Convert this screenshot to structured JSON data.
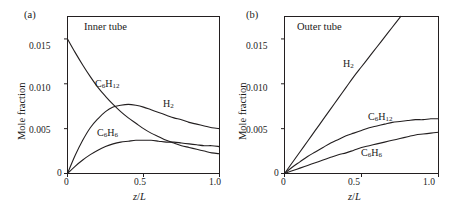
{
  "figure": {
    "panels": [
      {
        "tag": "(a)",
        "title": "Inner tube",
        "xlabel_italic": "z",
        "xlabel_slash": "/",
        "xlabel_italic2": "L",
        "ylabel": "Mole fraction",
        "xticks": [
          "0",
          "0.5",
          "1.0"
        ],
        "yticks": [
          "0",
          "0.005",
          "0.010",
          "0.015"
        ],
        "series_labels": {
          "h2": "H",
          "h2_sub": "2",
          "c6h12": "C",
          "c6h12_sub1": "6",
          "c6h12_mid": "H",
          "c6h12_sub2": "12",
          "c6h6": "C",
          "c6h6_sub1": "6",
          "c6h6_mid": "H",
          "c6h6_sub2": "6"
        }
      },
      {
        "tag": "(b)",
        "title": "Outer tube",
        "xlabel_italic": "z",
        "xlabel_slash": "/",
        "xlabel_italic2": "L",
        "ylabel": "Mole fraction",
        "xticks": [
          "0",
          "0.5",
          "1.0"
        ],
        "yticks": [
          "0",
          "0.005",
          "0.010",
          "0.015"
        ],
        "series_labels": {
          "h2": "H",
          "h2_sub": "2",
          "c6h12": "C",
          "c6h12_sub1": "6",
          "c6h12_mid": "H",
          "c6h12_sub2": "12",
          "c6h6": "C",
          "c6h6_sub1": "6",
          "c6h6_mid": "H",
          "c6h6_sub2": "6"
        }
      }
    ]
  },
  "chart_data": [
    {
      "type": "line",
      "title": "Inner tube",
      "panel": "(a)",
      "xlabel": "z/L",
      "ylabel": "Mole fraction",
      "xlim": [
        0,
        1.0
      ],
      "ylim": [
        0,
        0.0175
      ],
      "xticks": [
        0,
        0.5,
        1.0
      ],
      "yticks": [
        0,
        0.005,
        0.01,
        0.015
      ],
      "grid": false,
      "legend": "inline-curve-labels",
      "x": [
        0,
        0.05,
        0.1,
        0.15,
        0.2,
        0.25,
        0.3,
        0.35,
        0.4,
        0.45,
        0.5,
        0.55,
        0.6,
        0.65,
        0.7,
        0.75,
        0.8,
        0.85,
        0.9,
        0.95,
        1.0
      ],
      "series": [
        {
          "name": "C6H12",
          "values": [
            0.015,
            0.0135,
            0.0121,
            0.0108,
            0.0096,
            0.0086,
            0.0077,
            0.0069,
            0.0062,
            0.0056,
            0.005,
            0.0045,
            0.0041,
            0.0037,
            0.0034,
            0.0031,
            0.0029,
            0.0027,
            0.0025,
            0.0023,
            0.0022
          ]
        },
        {
          "name": "H2",
          "values": [
            0.0,
            0.002,
            0.0037,
            0.0051,
            0.0061,
            0.0069,
            0.0074,
            0.0076,
            0.0077,
            0.0076,
            0.0074,
            0.0071,
            0.0068,
            0.0065,
            0.0062,
            0.006,
            0.0057,
            0.0055,
            0.0053,
            0.0051,
            0.005
          ]
        },
        {
          "name": "C6H6",
          "values": [
            0.0,
            0.0008,
            0.0015,
            0.0021,
            0.0026,
            0.003,
            0.0033,
            0.0035,
            0.0036,
            0.0037,
            0.0037,
            0.0037,
            0.0036,
            0.0035,
            0.0035,
            0.0034,
            0.0033,
            0.0032,
            0.0031,
            0.0031,
            0.003
          ]
        }
      ]
    },
    {
      "type": "line",
      "title": "Outer tube",
      "panel": "(b)",
      "xlabel": "z/L",
      "ylabel": "Mole fraction",
      "xlim": [
        0,
        1.0
      ],
      "ylim": [
        0,
        0.0175
      ],
      "xticks": [
        0,
        0.5,
        1.0
      ],
      "yticks": [
        0,
        0.005,
        0.01,
        0.015
      ],
      "grid": false,
      "legend": "inline-curve-labels",
      "x": [
        0,
        0.05,
        0.1,
        0.15,
        0.2,
        0.25,
        0.3,
        0.35,
        0.4,
        0.45,
        0.5,
        0.55,
        0.6,
        0.65,
        0.7,
        0.75,
        0.8,
        0.85,
        0.9,
        0.95,
        1.0
      ],
      "series": [
        {
          "name": "H2",
          "values": [
            0.0,
            0.0012,
            0.0024,
            0.0036,
            0.0048,
            0.006,
            0.0072,
            0.0084,
            0.0096,
            0.0108,
            0.0119,
            0.013,
            0.0141,
            0.0152,
            0.0163,
            0.0174,
            0.0185,
            0.0196,
            0.0207,
            0.0218,
            0.0229
          ],
          "clipped_at_top": true,
          "note": "rises off the top of the axes near z/L = 0.84"
        },
        {
          "name": "C6H12",
          "values": [
            0.0,
            0.0007,
            0.0013,
            0.0019,
            0.0024,
            0.0029,
            0.0034,
            0.0038,
            0.0042,
            0.0045,
            0.0048,
            0.0051,
            0.0053,
            0.0055,
            0.0057,
            0.0058,
            0.0059,
            0.006,
            0.006,
            0.0061,
            0.0061
          ]
        },
        {
          "name": "C6H6",
          "values": [
            0.0,
            0.0003,
            0.0006,
            0.0009,
            0.0012,
            0.0015,
            0.0018,
            0.0021,
            0.0023,
            0.0026,
            0.0029,
            0.0031,
            0.0033,
            0.0035,
            0.0037,
            0.0039,
            0.0041,
            0.0043,
            0.0044,
            0.0045,
            0.0046
          ]
        }
      ]
    }
  ]
}
